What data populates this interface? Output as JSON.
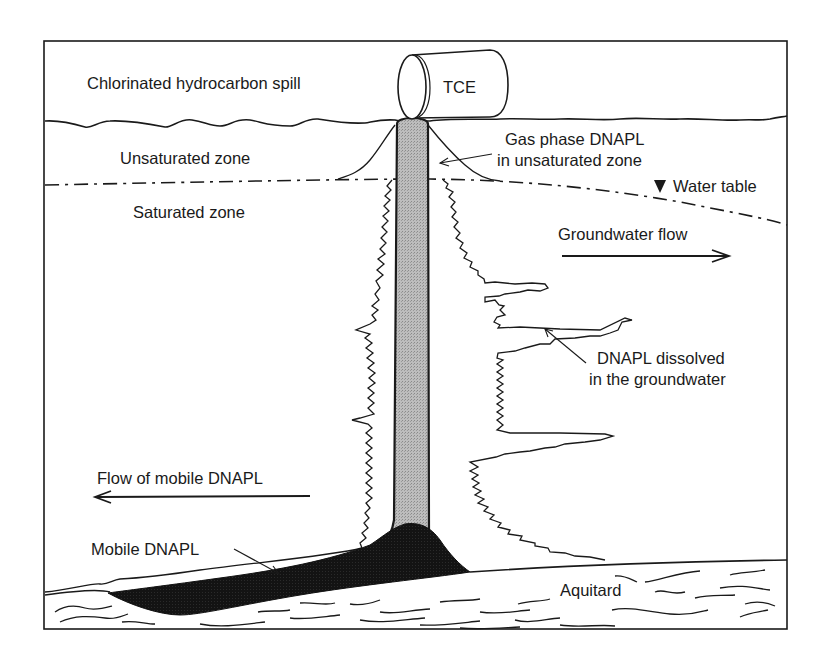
{
  "title": "Chlorinated hydrocarbon spill",
  "drum": {
    "label": "TCE"
  },
  "zones": {
    "unsaturated": "Unsaturated zone",
    "saturated": "Saturated zone"
  },
  "annotations": {
    "gas_phase_line1": "Gas phase DNAPL",
    "gas_phase_line2": "in unsaturated zone",
    "water_table": "Water table",
    "groundwater_flow": "Groundwater flow",
    "dissolved_line1": "DNAPL dissolved",
    "dissolved_line2": "in the groundwater",
    "flow_mobile": "Flow of mobile DNAPL",
    "mobile": "Mobile DNAPL",
    "aquitard": "Aquitard"
  },
  "icons": {
    "water_table_marker": "inverted-triangle",
    "flow_arrow_right": "arrow-right",
    "flow_arrow_left": "arrow-left"
  },
  "colors": {
    "line": "#1a1a1a",
    "dnapl_column": "#b5b5b5",
    "mobile_dnapl": "#141414",
    "background": "#ffffff"
  }
}
